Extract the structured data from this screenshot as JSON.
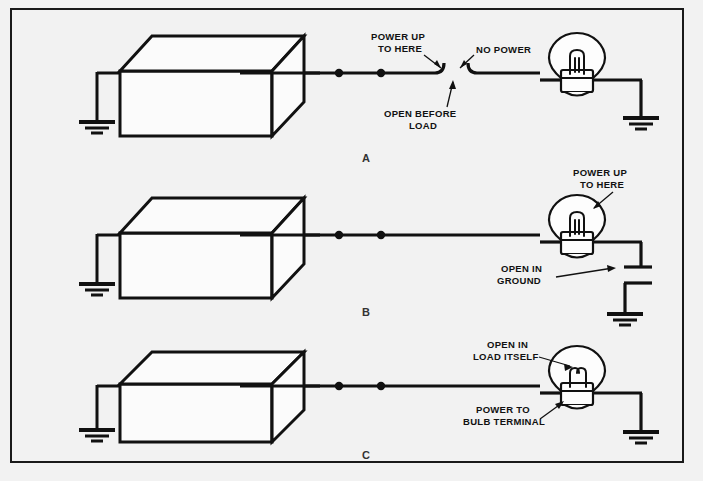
{
  "figure": {
    "background_color": "#f2f2f2",
    "line_color": "#111111",
    "frame": {
      "x": 11,
      "y": 9,
      "width": 672,
      "height": 453
    },
    "panels": [
      {
        "id": "A",
        "letter": "A",
        "description": "Open before load",
        "labels": [
          {
            "name": "power-up-to-here",
            "line1": "POWER UP",
            "line2": "TO HERE"
          },
          {
            "name": "no-power",
            "line1": "NO POWER",
            "line2": ""
          },
          {
            "name": "open-before-load",
            "line1": "OPEN BEFORE",
            "line2": "LOAD"
          }
        ],
        "bulb_lit": false,
        "break_location": "wire before load"
      },
      {
        "id": "B",
        "letter": "B",
        "description": "Open in ground",
        "labels": [
          {
            "name": "power-up-to-here",
            "line1": "POWER UP",
            "line2": "TO HERE"
          },
          {
            "name": "open-in-ground",
            "line1": "OPEN IN",
            "line2": "GROUND"
          }
        ],
        "bulb_lit": false,
        "break_location": "ground wire after load"
      },
      {
        "id": "C",
        "letter": "C",
        "description": "Open in load itself",
        "labels": [
          {
            "name": "open-in-load-itself",
            "line1": "OPEN IN",
            "line2": "LOAD ITSELF"
          },
          {
            "name": "power-to-bulb-terminal",
            "line1": "POWER TO",
            "line2": "BULB TERMINAL"
          }
        ],
        "bulb_lit": false,
        "break_location": "bulb filament"
      }
    ],
    "components": {
      "source_box_name": "power source box",
      "load_name": "light bulb",
      "ground_name": "chassis ground",
      "connector_dot_name": "wire connector"
    }
  }
}
